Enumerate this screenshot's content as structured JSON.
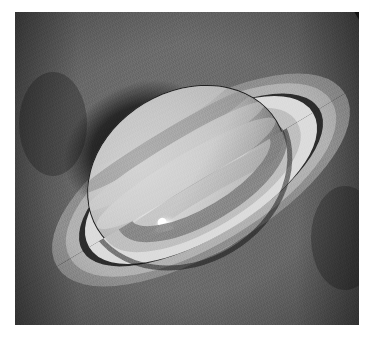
{
  "image": {
    "subject": "Saturn",
    "caption": "Saturn with ring system tilted toward the viewer, bright storm spot in the southern hemisphere",
    "alt_text": "Grayscale astronomical photograph of the planet Saturn and its rings",
    "media_type": "astronomical photograph",
    "color_mode": "grayscale",
    "border_color": "#ffffff",
    "canvas": {
      "width": 372,
      "height": 337
    },
    "plate": {
      "x": 15,
      "y": 12,
      "width": 344,
      "height": 313
    }
  },
  "scene": {
    "background_label": "space background",
    "background_color": "#1b1b1b",
    "background_highlight": "#2a2a2a",
    "ring_tilt_degrees": -31,
    "illumination": "upper left"
  },
  "planet": {
    "label": "Saturn globe",
    "center_x": 172,
    "center_y": 163,
    "radius_x": 104,
    "radius_y": 83,
    "rotation_degrees": -31,
    "body_color": "#b4b4b4",
    "highlight_color": "#d0d0d0",
    "limb_shadow_color": "#6e6e6e",
    "bands": [
      {
        "name": "north-polar-hood",
        "tone": "#bdbdbd",
        "offset": -0.78,
        "thickness": 0.2
      },
      {
        "name": "north-temperate-belt",
        "tone": "#9c9c9c",
        "offset": -0.48,
        "thickness": 0.12
      },
      {
        "name": "north-tropical-zone",
        "tone": "#c6c6c6",
        "offset": -0.27,
        "thickness": 0.16
      },
      {
        "name": "equatorial-zone",
        "tone": "#cecece",
        "offset": -0.02,
        "thickness": 0.22
      },
      {
        "name": "south-equatorial-belt",
        "tone": "#a4a4a4",
        "offset": 0.26,
        "thickness": 0.14
      },
      {
        "name": "south-temperate-zone",
        "tone": "#bcbcbc",
        "offset": 0.5,
        "thickness": 0.16
      },
      {
        "name": "south-polar-region",
        "tone": "#8f8f8f",
        "offset": 0.8,
        "thickness": 0.2
      }
    ]
  },
  "storm_spot": {
    "label": "bright storm spot",
    "center_x": 150,
    "center_y": 214,
    "width": 22,
    "height": 20,
    "core_color": "#ffffff",
    "halo_color": "#e6e6e6",
    "description": "bright white cloud feature in the southern hemisphere"
  },
  "rings": {
    "label": "ring system",
    "center_x": 186,
    "center_y": 168,
    "rotation_degrees": -31,
    "components": [
      {
        "name": "a-ring-outer-edge",
        "outer_rx": 168,
        "outer_ry": 66,
        "inner_rx": 152,
        "inner_ry": 60,
        "tone": "#9b9b9b"
      },
      {
        "name": "a-ring",
        "outer_rx": 152,
        "outer_ry": 60,
        "inner_rx": 138,
        "inner_ry": 54,
        "tone": "#b0b0b0"
      },
      {
        "name": "cassini-division",
        "outer_rx": 138,
        "outer_ry": 54,
        "inner_rx": 130,
        "inner_ry": 51,
        "tone": "#2e2e2e"
      },
      {
        "name": "b-ring-outer",
        "outer_rx": 130,
        "outer_ry": 51,
        "inner_rx": 112,
        "inner_ry": 44,
        "tone": "#d6d6d6"
      },
      {
        "name": "b-ring-inner",
        "outer_rx": 112,
        "outer_ry": 44,
        "inner_rx": 96,
        "inner_ry": 38,
        "tone": "#bebebe"
      },
      {
        "name": "c-ring",
        "outer_rx": 96,
        "outer_ry": 38,
        "inner_rx": 80,
        "inner_ry": 31,
        "tone": "#7d7d7d"
      }
    ],
    "shadow_on_rings": {
      "name": "planet-shadow-on-rings",
      "tone": "#3a3a3a",
      "side": "left of globe"
    },
    "shadow_on_planet": {
      "name": "ring-shadow-on-planet",
      "tone": "#6a6a6a",
      "side": "lower left limb"
    }
  },
  "annotations": {
    "visible_text": [],
    "labels_shown": false
  }
}
